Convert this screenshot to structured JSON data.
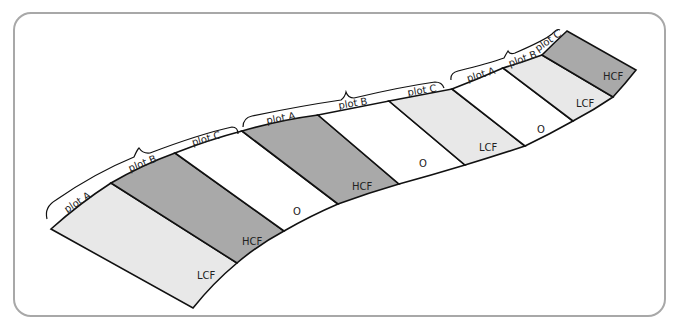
{
  "colors": {
    "HCF": "#a9a9a9",
    "LCF": "#e8e8e8",
    "O": "#ffffff",
    "outline": "#111111",
    "frame": "#a8a8a8"
  },
  "strips": [
    {
      "label": "LCF",
      "plot": "plot A",
      "group": 1
    },
    {
      "label": "HCF",
      "plot": "plot B",
      "group": 1
    },
    {
      "label": "O",
      "plot": "plot C",
      "group": 1
    },
    {
      "label": "HCF",
      "plot": "plot A",
      "group": 2
    },
    {
      "label": "O",
      "plot": "plot B",
      "group": 2
    },
    {
      "label": "LCF",
      "plot": "plot C",
      "group": 2
    },
    {
      "label": "O",
      "plot": "plot A",
      "group": 3
    },
    {
      "label": "LCF",
      "plot": "plot B",
      "group": 3
    },
    {
      "label": "HCF",
      "plot": "plot C",
      "group": 3
    }
  ],
  "plot_labels": [
    "plot A",
    "plot B",
    "plot C",
    "plot A",
    "plot B",
    "plot C",
    "plot A",
    "plot B",
    "plot C"
  ],
  "strip_labels": [
    "LCF",
    "HCF",
    "O",
    "HCF",
    "O",
    "LCF",
    "O",
    "LCF",
    "HCF"
  ]
}
